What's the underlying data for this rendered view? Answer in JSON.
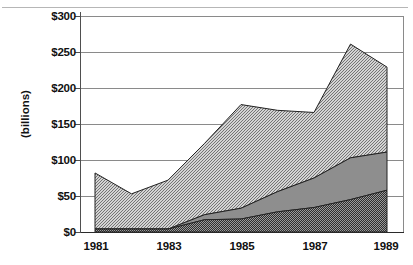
{
  "chart_data": {
    "type": "area",
    "stacked": true,
    "title": "",
    "xlabel": "",
    "ylabel": "(billions)",
    "x": [
      1981,
      1982,
      1983,
      1984,
      1985,
      1986,
      1987,
      1988,
      1989
    ],
    "xtick_labels": [
      "1981",
      "1983",
      "1985",
      "1987",
      "1989"
    ],
    "xtick_values": [
      1981,
      1983,
      1985,
      1987,
      1989
    ],
    "ytick_labels": [
      "$0",
      "$50",
      "$100",
      "$150",
      "$200",
      "$250",
      "$300"
    ],
    "ytick_values": [
      0,
      50,
      100,
      150,
      200,
      250,
      300
    ],
    "ylim": [
      0,
      300
    ],
    "xlim": [
      1981,
      1989
    ],
    "grid": true,
    "grid_axis": "y",
    "legend": "none",
    "series": [
      {
        "name": "series-bottom",
        "fill": "dark-dense-hatch",
        "color": "#4a4a4a",
        "values": [
          4,
          4,
          4,
          17,
          18,
          28,
          34,
          45,
          58
        ]
      },
      {
        "name": "series-middle",
        "fill": "solid-gray",
        "color": "#8c8c8c",
        "values": [
          0,
          0,
          0,
          7,
          15,
          28,
          41,
          58,
          53
        ]
      },
      {
        "name": "series-top",
        "fill": "light-diagonal-hatch",
        "color": "#bdbdbd",
        "values": [
          78,
          49,
          68,
          99,
          144,
          113,
          91,
          158,
          118
        ]
      }
    ],
    "cumulative_totals": [
      82,
      53,
      72,
      123,
      177,
      169,
      166,
      261,
      229
    ]
  },
  "style": {
    "axis_color": "#5a5a5a",
    "grid_color": "#8a8a8a",
    "frame_color": "#8a8a8a",
    "background": "#ffffff",
    "text_color": "#111111"
  }
}
